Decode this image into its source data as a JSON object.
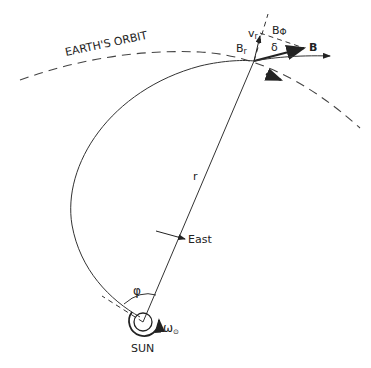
{
  "labels": {
    "orbit": "EARTH'S ORBIT",
    "vr": "v",
    "vr_sub": "r",
    "bphi": "B",
    "bphi_sub": "Φ",
    "delta": "δ",
    "B": "B",
    "br": "B",
    "br_sub": "r",
    "r": "r",
    "east": "East",
    "phi": "φ",
    "omega": "ω",
    "omega_sub": "⊙",
    "sun": "SUN"
  },
  "colors": {
    "line": "#222222",
    "background": "#ffffff"
  }
}
